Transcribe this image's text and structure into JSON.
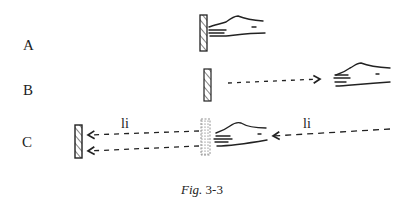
{
  "rows": [
    {
      "label": "A"
    },
    {
      "label": "B"
    },
    {
      "label": "C"
    }
  ],
  "annotations": {
    "li_left": "li",
    "li_right": "li"
  },
  "caption": {
    "fig": "Fig.",
    "number": "3-3"
  },
  "colors": {
    "ink": "#222222",
    "background": "#ffffff"
  }
}
